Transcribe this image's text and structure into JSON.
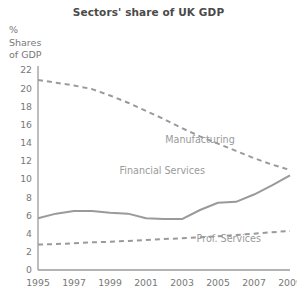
{
  "chart_data": {
    "type": "line",
    "title": "Sectors' share of UK GDP",
    "ylabel": "%\nShares\nof GDP",
    "xlabel": "",
    "xlim": [
      1995,
      2009
    ],
    "ylim": [
      0,
      22
    ],
    "grid": false,
    "legend_position": "inline-annotations",
    "x": [
      1995,
      1996,
      1997,
      1998,
      1999,
      2000,
      2001,
      2002,
      2003,
      2004,
      2005,
      2006,
      2007,
      2008,
      2009
    ],
    "ytick_labels": [
      "0",
      "2",
      "4",
      "6",
      "8",
      "10",
      "12",
      "14",
      "16",
      "18",
      "20",
      "22"
    ],
    "yticks": [
      0,
      2,
      4,
      6,
      8,
      10,
      12,
      14,
      16,
      18,
      20,
      22
    ],
    "xtick_labels": [
      "1995",
      "1997",
      "1999",
      "2001",
      "2003",
      "2005",
      "2007",
      "2009"
    ],
    "xticks": [
      1995,
      1997,
      1999,
      2001,
      2003,
      2005,
      2007,
      2009
    ],
    "series": [
      {
        "name": "Manufacturing",
        "style": "dashed",
        "color": "#9a9a9a",
        "label_x": 2004.0,
        "label_y": 14.0,
        "values": [
          20.9,
          20.6,
          20.3,
          19.9,
          19.2,
          18.4,
          17.5,
          16.6,
          15.6,
          14.7,
          13.9,
          13.1,
          12.3,
          11.6,
          11.0
        ]
      },
      {
        "name": "Financial Services",
        "style": "solid",
        "color": "#9a9a9a",
        "label_x": 2001.9,
        "label_y": 10.6,
        "values": [
          5.7,
          6.2,
          6.5,
          6.5,
          6.3,
          6.2,
          5.7,
          5.6,
          5.6,
          6.6,
          7.4,
          7.5,
          8.3,
          9.3,
          10.4
        ]
      },
      {
        "name": "Prof. Services",
        "style": "dashed",
        "color": "#9a9a9a",
        "label_x": 2005.6,
        "label_y": 3.1,
        "values": [
          2.8,
          2.85,
          2.95,
          3.05,
          3.1,
          3.2,
          3.3,
          3.4,
          3.5,
          3.6,
          3.7,
          3.85,
          4.0,
          4.15,
          4.3
        ]
      }
    ]
  }
}
